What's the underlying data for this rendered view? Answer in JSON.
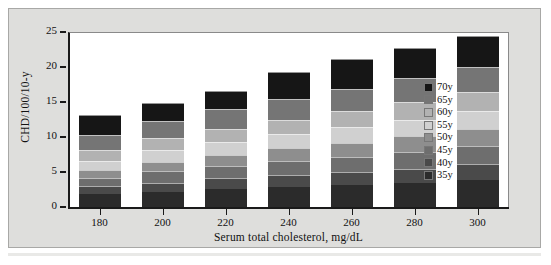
{
  "chart_data": {
    "type": "bar",
    "stacked": true,
    "title": "",
    "subtitle": "",
    "xlabel": "Serum total cholesterol, mg/dL",
    "ylabel": "CHD/100/10-y",
    "categories": [
      "180",
      "200",
      "220",
      "240",
      "260",
      "280",
      "300"
    ],
    "x": [
      180,
      200,
      220,
      240,
      260,
      280,
      300
    ],
    "ylim": [
      0,
      25
    ],
    "yticks": [
      0,
      5,
      10,
      15,
      20,
      25
    ],
    "ytick_labels": [
      "0",
      "5",
      "10",
      "15",
      "20",
      "25"
    ],
    "grid": false,
    "legend_position": "right-inside",
    "series": [
      {
        "name": "35y",
        "color": "#2b2b2b",
        "values": [
          1.9,
          2.2,
          2.6,
          2.9,
          3.1,
          3.4,
          3.9
        ]
      },
      {
        "name": "40y",
        "color": "#4a4a4a",
        "values": [
          1.1,
          1.3,
          1.5,
          1.7,
          1.9,
          2.1,
          2.2
        ]
      },
      {
        "name": "45y",
        "color": "#6e6e6e",
        "values": [
          1.1,
          1.6,
          1.8,
          2.0,
          2.2,
          2.4,
          2.6
        ]
      },
      {
        "name": "50y",
        "color": "#8e8e8e",
        "values": [
          1.2,
          1.4,
          1.6,
          1.8,
          2.0,
          2.2,
          2.4
        ]
      },
      {
        "name": "55y",
        "color": "#d0d0d0",
        "values": [
          1.3,
          1.6,
          1.8,
          2.0,
          2.2,
          2.4,
          2.6
        ]
      },
      {
        "name": "60y",
        "color": "#b2b2b2",
        "values": [
          1.5,
          1.7,
          1.9,
          2.1,
          2.3,
          2.5,
          2.7
        ]
      },
      {
        "name": "65y",
        "color": "#757575",
        "values": [
          2.2,
          2.5,
          2.8,
          3.0,
          3.2,
          3.4,
          3.6
        ]
      },
      {
        "name": "70y",
        "color": "#161616",
        "values": [
          2.8,
          2.5,
          2.6,
          3.8,
          4.2,
          4.3,
          4.5
        ]
      }
    ],
    "stack_order_bottom_to_top": [
      "35y",
      "40y",
      "45y",
      "50y",
      "55y",
      "60y",
      "65y",
      "70y"
    ],
    "totals": [
      15.1,
      16.7,
      18.5,
      20.1,
      21.8,
      23.0,
      24.4
    ]
  },
  "legend": {
    "entries": [
      {
        "label": "70y",
        "color": "#161616"
      },
      {
        "label": "65y",
        "color": "#757575"
      },
      {
        "label": "60y",
        "color": "#b2b2b2"
      },
      {
        "label": "55y",
        "color": "#d0d0d0"
      },
      {
        "label": "50y",
        "color": "#8e8e8e"
      },
      {
        "label": "45y",
        "color": "#6e6e6e"
      },
      {
        "label": "40y",
        "color": "#4a4a4a"
      },
      {
        "label": "35y",
        "color": "#2b2b2b"
      }
    ]
  },
  "colors": {
    "panel_background": "#dededc",
    "panel_border": "#a8a8a6",
    "plot_background": "#ffffff",
    "axis": "#1a1a1a",
    "text": "#111111"
  }
}
